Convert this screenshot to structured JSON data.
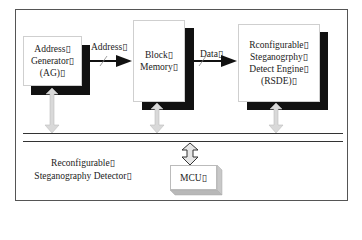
{
  "diagram": {
    "blocks": [
      {
        "id": "ag",
        "lines": [
          "Address▯",
          "Generator▯",
          "(AG)▯"
        ]
      },
      {
        "id": "block_memory",
        "lines": [
          "Block▯",
          "Memory▯"
        ]
      },
      {
        "id": "rsde",
        "lines": [
          "Rconfigurable▯",
          "Steganogrphy▯",
          "Detect Engine▯",
          "(RSDE)▯"
        ]
      },
      {
        "id": "mcu",
        "lines": [
          "MCU▯"
        ]
      }
    ],
    "edges": [
      {
        "from": "ag",
        "to": "block_memory",
        "label": "Address▯"
      },
      {
        "from": "block_memory",
        "to": "rsde",
        "label": "Data▯"
      }
    ],
    "caption": [
      "Reconfigurable▯",
      "Steganography Detector▯"
    ],
    "colors": {
      "shadow": "#111111",
      "bus_arrow_fill": "#d9d9d9",
      "frame": "#555555"
    }
  }
}
